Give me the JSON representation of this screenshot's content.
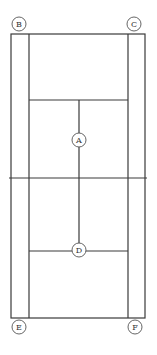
{
  "diagram": {
    "type": "tennis-court-top-view",
    "colors": {
      "line": "#3a3a3a",
      "marker_stroke": "#555555",
      "background": "#ffffff"
    },
    "markers": [
      {
        "id": "B",
        "label": "B",
        "position": "top-left corner"
      },
      {
        "id": "C",
        "label": "C",
        "position": "top-right corner"
      },
      {
        "id": "A",
        "label": "A",
        "position": "center line, upper half"
      },
      {
        "id": "D",
        "label": "D",
        "position": "center service line, lower half"
      },
      {
        "id": "E",
        "label": "E",
        "position": "bottom-left corner"
      },
      {
        "id": "F",
        "label": "F",
        "position": "bottom-right corner"
      }
    ]
  }
}
